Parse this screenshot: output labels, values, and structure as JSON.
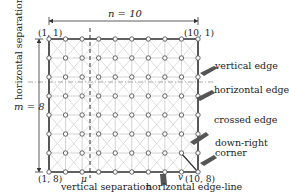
{
  "diagram": {
    "type": "grid-lattice",
    "columns": 10,
    "rows": 8,
    "colors": {
      "grid_line": "#c8c8c8",
      "diagonal": "#d4d4d4",
      "border": "#333333",
      "node_fill": "#ffffff",
      "node_stroke": "#555555",
      "separation_line": "#aaaaaa",
      "pointer": "#555555",
      "text": "#222222"
    },
    "dimension_labels": {
      "width": "n = 10",
      "height": "m = 8"
    },
    "corner_labels": {
      "top_left": "(1, 1)",
      "top_right": "(10, 1)",
      "bottom_left": "(1, 8)",
      "bottom_right": "(10, 8)"
    },
    "point_labels": {
      "mu": "μ",
      "nu": "v"
    },
    "separation_labels": {
      "horizontal": "horizontal separation",
      "vertical": "vertical separation"
    },
    "annotations": [
      {
        "id": "vertical-edge",
        "label": "vertical edge"
      },
      {
        "id": "horizontal-edge",
        "label": "horizontal edge"
      },
      {
        "id": "crossed-edge",
        "label": "crossed edge"
      },
      {
        "id": "down-right-corner",
        "label": "down-right\ncorner",
        "line1": "down-right",
        "line2": "corner"
      },
      {
        "id": "horizontal-edge-line",
        "label": "horizontal edge-line"
      }
    ]
  }
}
